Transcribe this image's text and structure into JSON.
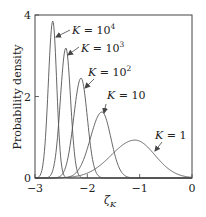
{
  "chart_data": {
    "type": "line",
    "title": "",
    "xlabel": "ζ_K",
    "ylabel": "Probability density",
    "xlim": [
      -3,
      0
    ],
    "ylim": [
      0,
      4
    ],
    "x_ticks": [
      -3,
      -2,
      -1,
      0
    ],
    "x_tick_labels": [
      "−3",
      "−2",
      "−1",
      "0"
    ],
    "y_ticks": [
      0,
      2,
      4
    ],
    "y_tick_labels": [
      "0",
      "2",
      "4"
    ],
    "grid": false,
    "legend": "none (inline annotations with arrows)",
    "series": [
      {
        "name": "K = 10^4",
        "label_base": "K = 10",
        "label_sup": "4",
        "peak_x": -2.66,
        "peak_y": 3.85,
        "sigma_left": 0.085,
        "sigma_right": 0.075
      },
      {
        "name": "K = 10^3",
        "label_base": "K = 10",
        "label_sup": "3",
        "peak_x": -2.41,
        "peak_y": 3.19,
        "sigma_left": 0.105,
        "sigma_right": 0.09
      },
      {
        "name": "K = 10^2",
        "label_base": "K = 10",
        "label_sup": "2",
        "peak_x": -2.12,
        "peak_y": 2.45,
        "sigma_left": 0.14,
        "sigma_right": 0.12
      },
      {
        "name": "K = 10",
        "label_base": "K = 10",
        "label_sup": "",
        "peak_x": -1.72,
        "peak_y": 1.62,
        "sigma_left": 0.22,
        "sigma_right": 0.17
      },
      {
        "name": "K = 1",
        "label_base": "K = 1",
        "label_sup": "",
        "peak_x": -1.09,
        "peak_y": 0.93,
        "sigma_left": 0.45,
        "sigma_right": 0.38
      }
    ],
    "annotations": [
      {
        "series": "K = 10^4",
        "text_x": 72,
        "text_y": 34,
        "arrow_from": [
          70,
          30
        ],
        "arrow_to": [
          56,
          37
        ]
      },
      {
        "series": "K = 10^3",
        "text_x": 81,
        "text_y": 52,
        "arrow_from": [
          79,
          47
        ],
        "arrow_to": [
          68,
          55
        ]
      },
      {
        "series": "K = 10^2",
        "text_x": 88,
        "text_y": 76,
        "arrow_from": [
          94,
          79
        ],
        "arrow_to": [
          85,
          88
        ]
      },
      {
        "series": "K = 10",
        "text_x": 107,
        "text_y": 99,
        "arrow_from": [
          106,
          104
        ],
        "arrow_to": [
          104,
          113
        ]
      },
      {
        "series": "K = 1",
        "text_x": 155,
        "text_y": 139,
        "arrow_from": [
          162,
          142
        ],
        "arrow_to": [
          155,
          151
        ]
      }
    ]
  },
  "colors": {
    "line": "#555555",
    "axis": "#444444",
    "text": "#222222",
    "background": "#ffffff"
  }
}
